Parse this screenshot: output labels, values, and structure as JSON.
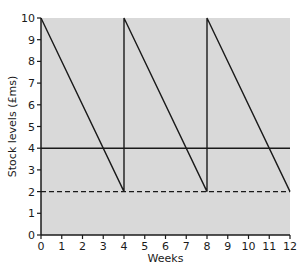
{
  "chart_data": {
    "type": "line",
    "title": "",
    "xlabel": "Weeks",
    "ylabel": "Stock levels (£ms)",
    "xlim": [
      0,
      12
    ],
    "ylim": [
      0,
      10
    ],
    "x_ticks": [
      0,
      1,
      2,
      3,
      4,
      5,
      6,
      7,
      8,
      9,
      10,
      11,
      12
    ],
    "y_ticks": [
      0,
      1,
      2,
      3,
      4,
      5,
      6,
      7,
      8,
      9,
      10
    ],
    "grid": false,
    "legend": null,
    "background_color": "#d9d9d9",
    "series": [
      {
        "name": "Stock level",
        "style": "solid",
        "color": "#1a1a1a",
        "x": [
          0,
          4,
          4,
          8,
          8,
          12
        ],
        "y": [
          10,
          2,
          10,
          2,
          10,
          2
        ]
      },
      {
        "name": "Reorder level",
        "style": "solid",
        "color": "#1a1a1a",
        "x": [
          0,
          12
        ],
        "y": [
          4,
          4
        ]
      },
      {
        "name": "Buffer stock",
        "style": "dashed",
        "color": "#1a1a1a",
        "x": [
          0,
          12
        ],
        "y": [
          2,
          2
        ]
      }
    ]
  }
}
